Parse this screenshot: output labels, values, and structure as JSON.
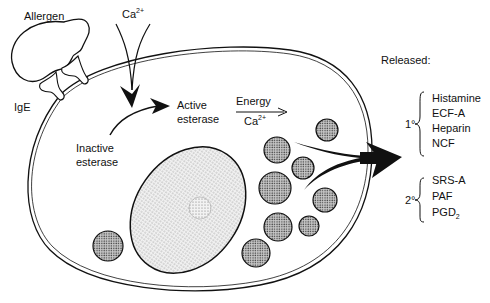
{
  "diagram": {
    "labels": {
      "allergen": "Allergen",
      "ige": "IgE",
      "calcium_in": "Ca",
      "calcium_in_sup": "2+",
      "inactive_esterase_line1": "Inactive",
      "inactive_esterase_line2": "esterase",
      "active_esterase_line1": "Active",
      "active_esterase_line2": "esterase",
      "energy": "Energy",
      "calcium_cofactor": "Ca",
      "calcium_cofactor_sup": "2+",
      "released_header": "Released:"
    },
    "released": {
      "primary": {
        "label": "1°",
        "mediators": [
          "Histamine",
          "ECF-A",
          "Heparin",
          "NCF"
        ]
      },
      "secondary": {
        "label": "2°",
        "mediators": [
          "SRS-A",
          "PAF",
          "PGD"
        ],
        "pgd_subscript": "2"
      }
    },
    "colors": {
      "line": "#111111",
      "background": "#ffffff",
      "granule_fill": "#9a9a9a",
      "nucleus_fill": "#e6e6e6"
    }
  }
}
